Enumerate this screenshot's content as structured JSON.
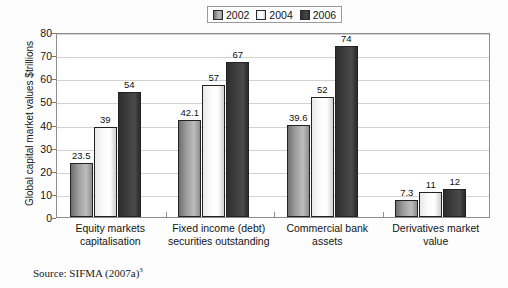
{
  "chart_data": {
    "type": "bar",
    "title": "",
    "xlabel": "",
    "ylabel": "Global capital market values $trillions",
    "ylim": [
      0,
      80
    ],
    "ytick_step": 10,
    "yticks": [
      "80",
      "70",
      "60",
      "50",
      "40",
      "30",
      "20",
      "10",
      "0"
    ],
    "grid": true,
    "legend_position": "top-center",
    "categories": [
      "Equity markets capitalisation",
      "Fixed income (debt) securities outstanding",
      "Commercial bank assets",
      "Derivatives market value"
    ],
    "category_lines": [
      [
        "Equity markets",
        "capitalisation"
      ],
      [
        "Fixed income (debt)",
        "securities outstanding"
      ],
      [
        "Commercial bank",
        "assets"
      ],
      [
        "Derivatives market",
        "value"
      ]
    ],
    "series": [
      {
        "name": "2002",
        "values": [
          23.5,
          42.1,
          39.6,
          7.3
        ],
        "labels": [
          "23.5",
          "42.1",
          "39.6",
          "7.3"
        ],
        "color": "#9d9d9d"
      },
      {
        "name": "2004",
        "values": [
          39,
          57,
          52,
          11
        ],
        "labels": [
          "39",
          "57",
          "52",
          "11"
        ],
        "color": "#fbfbfb"
      },
      {
        "name": "2006",
        "values": [
          54,
          67,
          74,
          12
        ],
        "labels": [
          "54",
          "67",
          "74",
          "12"
        ],
        "color": "#3d3d3d"
      }
    ]
  },
  "legend": {
    "items": [
      {
        "label": "2002"
      },
      {
        "label": "2004"
      },
      {
        "label": "2006"
      }
    ]
  },
  "source": {
    "text": "Source: SIFMA (2007a)",
    "footnote": "3"
  }
}
